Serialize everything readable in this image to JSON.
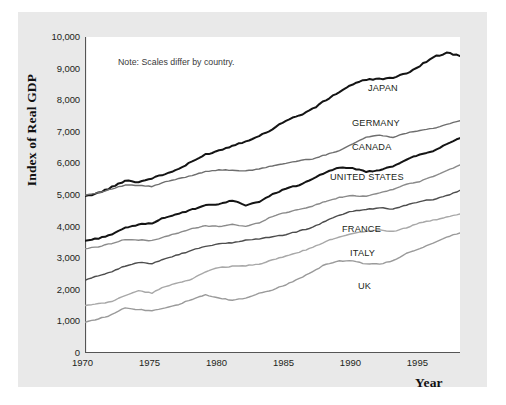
{
  "note": "Note: Scales differ by country.",
  "axes": {
    "ytitle": "Index of Real GDP",
    "xtitle": "Year",
    "yticks": [
      "10,000",
      "9,000",
      "8,000",
      "7,000",
      "6,000",
      "5,000",
      "4,000",
      "3,000",
      "2,000",
      "1,000",
      "0"
    ],
    "xticks": [
      "1970",
      "1975",
      "1980",
      "1985",
      "1990",
      "1995"
    ]
  },
  "labels": {
    "japan": "JAPAN",
    "germany": "GERMANY",
    "canada": "CANADA",
    "united_states": "UNITED STATES",
    "france": "FRANCE",
    "italy": "ITALY",
    "uk": "UK"
  },
  "colors": {
    "japan": "#141414",
    "germany": "#6e6e6e",
    "canada": "#141414",
    "united_states": "#8a8a8a",
    "france": "#4d4d4d",
    "italy": "#a8a8a8",
    "uk": "#9a9a9a",
    "panel": "#e9e9e9",
    "plot": "#ffffff",
    "axis": "#555555"
  },
  "chart_data": {
    "type": "line",
    "title": "",
    "xlabel": "Year",
    "ylabel": "Index of Real GDP",
    "xlim": [
      1970,
      1998
    ],
    "ylim": [
      0,
      10000
    ],
    "grid": false,
    "legend": "inline-right-of-series",
    "annotations": [
      "Note: Scales differ by country."
    ],
    "x": [
      1970,
      1971,
      1972,
      1973,
      1974,
      1975,
      1976,
      1977,
      1978,
      1979,
      1980,
      1981,
      1982,
      1983,
      1984,
      1985,
      1986,
      1987,
      1988,
      1989,
      1990,
      1991,
      1992,
      1993,
      1994,
      1995,
      1996,
      1997,
      1998
    ],
    "series": [
      {
        "name": "JAPAN",
        "color": "#141414",
        "values": [
          4950,
          5120,
          5380,
          5700,
          5620,
          5800,
          5990,
          6230,
          6560,
          6900,
          7080,
          7300,
          7520,
          7740,
          8080,
          8470,
          8700,
          9000,
          9420,
          9800,
          10150,
          10350,
          10400,
          10430,
          10650,
          11000,
          11400,
          11600,
          11450
        ]
      },
      {
        "name": "GERMANY",
        "color": "#6e6e6e",
        "values": [
          5000,
          5150,
          5380,
          5620,
          5600,
          5530,
          5820,
          6020,
          6230,
          6480,
          6560,
          6560,
          6500,
          6620,
          6830,
          6980,
          7150,
          7270,
          7520,
          7800,
          8200,
          8620,
          8750,
          8620,
          8880,
          9050,
          9180,
          9400,
          9650
        ]
      },
      {
        "name": "CANADA",
        "color": "#141414",
        "values": [
          3550,
          3660,
          3840,
          4120,
          4270,
          4340,
          4600,
          4750,
          4940,
          5120,
          5180,
          5340,
          5140,
          5290,
          5610,
          5890,
          6030,
          6290,
          6620,
          6800,
          6780,
          6620,
          6690,
          6860,
          7180,
          7380,
          7520,
          7850,
          8120
        ]
      },
      {
        "name": "UNITED STATES",
        "color": "#8a8a8a",
        "values": [
          3300,
          3400,
          3570,
          3760,
          3730,
          3700,
          3910,
          4080,
          4300,
          4430,
          4410,
          4510,
          4400,
          4590,
          4910,
          5100,
          5250,
          5420,
          5650,
          5840,
          5930,
          5900,
          6080,
          6240,
          6490,
          6640,
          6880,
          7160,
          7450
        ]
      },
      {
        "name": "FRANCE",
        "color": "#4d4d4d",
        "values": [
          2300,
          2420,
          2530,
          2670,
          2760,
          2740,
          2870,
          2970,
          3080,
          3190,
          3240,
          3280,
          3340,
          3380,
          3430,
          3490,
          3580,
          3680,
          3840,
          4000,
          4100,
          4140,
          4190,
          4150,
          4260,
          4350,
          4400,
          4500,
          4640
        ]
      },
      {
        "name": "ITALY",
        "color": "#a8a8a8",
        "values": [
          1500,
          1530,
          1570,
          1680,
          1760,
          1720,
          1840,
          1900,
          1970,
          2090,
          2170,
          2190,
          2200,
          2230,
          2300,
          2370,
          2440,
          2520,
          2630,
          2710,
          2770,
          2810,
          2830,
          2800,
          2870,
          2960,
          3000,
          3050,
          3110
        ]
      },
      {
        "name": "UK",
        "color": "#9a9a9a",
        "values": [
          980,
          1010,
          1050,
          1120,
          1100,
          1090,
          1120,
          1150,
          1200,
          1240,
          1210,
          1190,
          1210,
          1260,
          1290,
          1340,
          1400,
          1470,
          1540,
          1570,
          1570,
          1540,
          1540,
          1570,
          1640,
          1690,
          1740,
          1800,
          1840
        ]
      }
    ],
    "series_order_top_to_bottom": [
      "JAPAN",
      "GERMANY",
      "CANADA",
      "UNITED STATES",
      "FRANCE",
      "ITALY",
      "UK"
    ]
  }
}
